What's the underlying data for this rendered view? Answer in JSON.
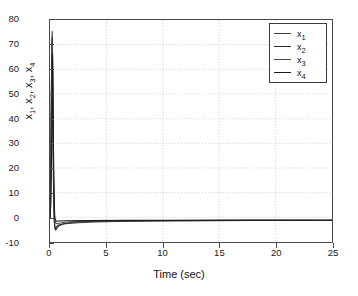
{
  "figure": {
    "background_color": "#ffffff",
    "axis_color": "#4a4a4a",
    "grid_color": "#b9b9b9"
  },
  "chart_data": {
    "type": "line",
    "title": "",
    "xlabel": "Time (sec)",
    "ylabel": "x_1, x_2, x_3, x_4",
    "ylabel_parts": [
      {
        "base": "x",
        "sub": "1",
        "sep": ", "
      },
      {
        "base": "x",
        "sub": "2",
        "sep": ", "
      },
      {
        "base": "x",
        "sub": "3",
        "sep": ", "
      },
      {
        "base": "x",
        "sub": "4",
        "sep": ""
      }
    ],
    "xlim": [
      0,
      25
    ],
    "ylim": [
      -10,
      80
    ],
    "xticks": [
      0,
      5,
      10,
      15,
      20,
      25
    ],
    "xticklabels": [
      "0",
      "5",
      "10",
      "15",
      "20",
      "25"
    ],
    "yticks": [
      -10,
      0,
      10,
      20,
      30,
      40,
      50,
      60,
      70,
      80
    ],
    "yticklabels": [
      "-10",
      "0",
      "10",
      "20",
      "30",
      "40",
      "50",
      "60",
      "70",
      "80"
    ],
    "grid": true,
    "grid_style": "dotted",
    "legend_position": "upper right",
    "legend": [
      {
        "name": "x",
        "sub": "1",
        "color": "#3f3f3f"
      },
      {
        "name": "x",
        "sub": "2",
        "color": "#2a2a2a"
      },
      {
        "name": "x",
        "sub": "3",
        "color": "#4b4b4b"
      },
      {
        "name": "x",
        "sub": "4",
        "color": "#1c1c1c"
      }
    ],
    "series": [
      {
        "name": "x1",
        "color": "#3f3f3f",
        "points": [
          [
            0.0,
            0.0
          ],
          [
            0.06,
            18.0
          ],
          [
            0.11,
            46.0
          ],
          [
            0.16,
            68.0
          ],
          [
            0.2,
            75.3
          ],
          [
            0.24,
            62.0
          ],
          [
            0.28,
            36.0
          ],
          [
            0.32,
            12.0
          ],
          [
            0.38,
            -1.5
          ],
          [
            0.45,
            -4.6
          ],
          [
            0.55,
            -4.0
          ],
          [
            0.7,
            -3.2
          ],
          [
            1.0,
            -2.8
          ],
          [
            1.6,
            -2.5
          ],
          [
            2.5,
            -2.2
          ],
          [
            4.0,
            -1.9
          ],
          [
            6.0,
            -1.7
          ],
          [
            9.0,
            -1.5
          ],
          [
            13.0,
            -1.35
          ],
          [
            18.0,
            -1.25
          ],
          [
            25.0,
            -1.2
          ]
        ]
      },
      {
        "name": "x2",
        "color": "#2a2a2a",
        "points": [
          [
            0.0,
            0.0
          ],
          [
            0.05,
            12.0
          ],
          [
            0.1,
            40.0
          ],
          [
            0.15,
            64.0
          ],
          [
            0.19,
            73.0
          ],
          [
            0.23,
            58.0
          ],
          [
            0.27,
            30.0
          ],
          [
            0.33,
            6.0
          ],
          [
            0.4,
            -3.0
          ],
          [
            0.5,
            -5.2
          ],
          [
            0.62,
            -4.4
          ],
          [
            0.8,
            -3.4
          ],
          [
            1.2,
            -2.6
          ],
          [
            2.0,
            -2.0
          ],
          [
            3.5,
            -1.7
          ],
          [
            6.0,
            -1.5
          ],
          [
            10.0,
            -1.35
          ],
          [
            16.0,
            -1.25
          ],
          [
            25.0,
            -1.2
          ]
        ]
      },
      {
        "name": "x3",
        "color": "#4b4b4b",
        "points": [
          [
            0.0,
            0.0
          ],
          [
            0.07,
            10.0
          ],
          [
            0.13,
            35.0
          ],
          [
            0.18,
            58.0
          ],
          [
            0.21,
            70.0
          ],
          [
            0.26,
            52.0
          ],
          [
            0.31,
            22.0
          ],
          [
            0.38,
            2.0
          ],
          [
            0.48,
            -2.2
          ],
          [
            0.6,
            -2.6
          ],
          [
            0.9,
            -2.3
          ],
          [
            1.5,
            -1.9
          ],
          [
            3.0,
            -1.6
          ],
          [
            6.0,
            -1.4
          ],
          [
            11.0,
            -1.3
          ],
          [
            18.0,
            -1.22
          ],
          [
            25.0,
            -1.2
          ]
        ]
      },
      {
        "name": "x4",
        "color": "#1c1c1c",
        "points": [
          [
            0.0,
            0.0
          ],
          [
            0.08,
            6.0
          ],
          [
            0.14,
            26.0
          ],
          [
            0.19,
            50.0
          ],
          [
            0.22,
            66.0
          ],
          [
            0.27,
            44.0
          ],
          [
            0.34,
            15.0
          ],
          [
            0.42,
            -0.5
          ],
          [
            0.55,
            -1.6
          ],
          [
            0.8,
            -1.5
          ],
          [
            1.4,
            -1.4
          ],
          [
            3.0,
            -1.32
          ],
          [
            7.0,
            -1.25
          ],
          [
            14.0,
            -1.22
          ],
          [
            25.0,
            -1.2
          ]
        ]
      }
    ]
  }
}
